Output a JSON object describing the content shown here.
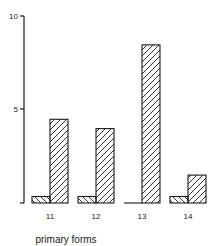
{
  "chart_data": {
    "type": "bar",
    "title": "",
    "xlabel": "primary forms",
    "ylabel": "",
    "ylim": [
      0,
      10
    ],
    "yticks": [
      5,
      10
    ],
    "grid": false,
    "legend": "none",
    "categories": [
      "11",
      "12",
      "13",
      "14"
    ],
    "series": [
      {
        "name": "series A (back-hatched, left bar)",
        "pattern": "backslash-hatch",
        "values": [
          0.35,
          0.35,
          0,
          0.35
        ]
      },
      {
        "name": "series B (forward-hatched, right bar)",
        "pattern": "slash-hatch",
        "values": [
          4.5,
          4.0,
          8.5,
          1.5
        ]
      }
    ]
  },
  "colors": {
    "stroke": "#1a1a1a",
    "background": "#ffffff"
  }
}
